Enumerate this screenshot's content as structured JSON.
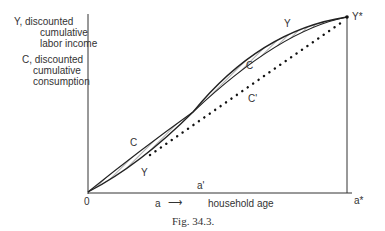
{
  "yaxis_label": {
    "line1": "Y, discounted",
    "line2": "cumulative",
    "line3": "labor income",
    "line4": "C, discounted",
    "line5": "cumulative",
    "line6": "consumption"
  },
  "curve_labels": {
    "y_upper": "Y",
    "c_upper": "C",
    "c_prime": "C'",
    "c_lower": "C",
    "y_lower": "Y",
    "y_star": "Y*"
  },
  "axis": {
    "origin": "0",
    "a_prime": "a'",
    "a_star": "a*",
    "xlabel_var": "a",
    "xlabel_arrow": "⟶",
    "xlabel": "household age"
  },
  "caption": "Fig. 34.3."
}
